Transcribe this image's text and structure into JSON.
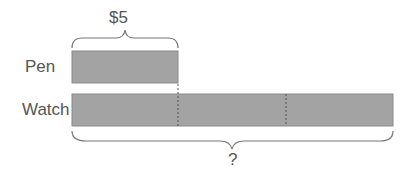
{
  "diagram": {
    "type": "bar-model",
    "top_label": "$5",
    "bottom_label": "?",
    "rows": [
      {
        "label": "Pen",
        "units": 1
      },
      {
        "label": "Watch",
        "units": 3
      }
    ],
    "colors": {
      "bar_fill": "#a3a3a3",
      "bar_stroke": "#8a8a8a",
      "brace": "#777777",
      "text": "#555555"
    }
  }
}
